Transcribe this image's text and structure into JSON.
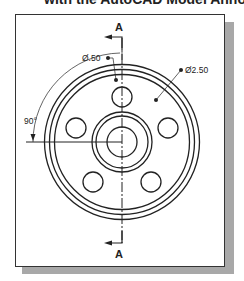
{
  "caption": {
    "text": "with the AutoCAD Model Annotation"
  },
  "drawing": {
    "section_label_top": "A",
    "section_label_bottom": "A",
    "dim_small_hole": "Ø.50",
    "dim_bolt_circle": "Ø2.50",
    "dim_angle": "90°",
    "colors": {
      "line": "#222222",
      "frame": "#333333",
      "shadow": "#a8a8a8",
      "background": "#ffffff"
    },
    "geometry": {
      "center": [
        122,
        142
      ],
      "rim_radii": [
        77.5,
        72.5,
        67.5
      ],
      "hub_radii": [
        30,
        26
      ],
      "bore_radius": 15,
      "bolt_hole_radius": 10,
      "bolt_hole_count": 5
    }
  }
}
